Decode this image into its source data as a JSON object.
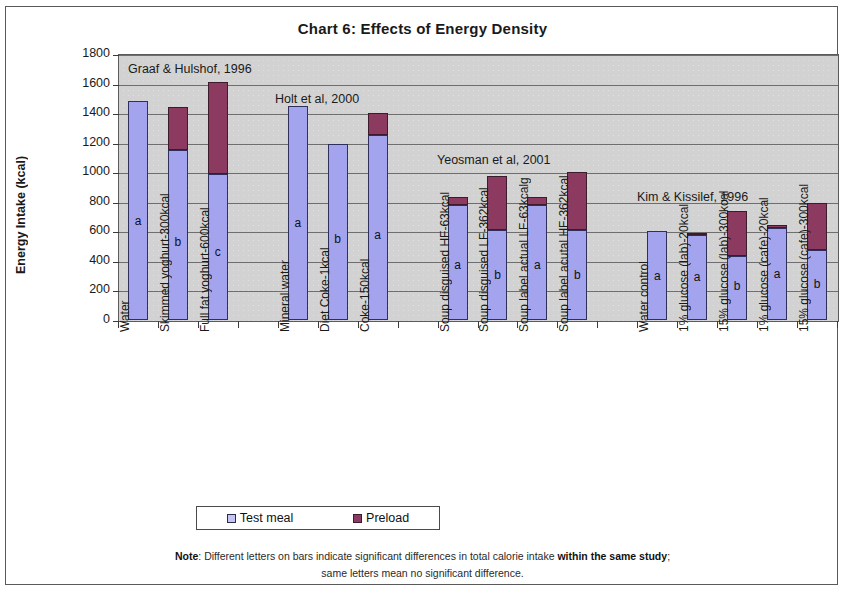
{
  "title": "Chart 6:  Effects of Energy Density",
  "axes": {
    "y_title": "Energy Intake (kcal)",
    "y_ticks": [
      "1800",
      "1600",
      "1400",
      "1200",
      "1000",
      "800",
      "600",
      "400",
      "200",
      "0"
    ]
  },
  "legend": {
    "test_label": "Test meal",
    "preload_label": "Preload"
  },
  "footnote": {
    "note_label": "Note",
    "line1_a": ": Different letters on bars indicate significant differences in total calorie intake ",
    "line1_bold": "within the same study",
    "line1_b": ";",
    "line2": "same letters mean no significant difference."
  },
  "studies": [
    {
      "name": "Graaf &  Hulshof, 1996"
    },
    {
      "name": "Holt et al, 2000"
    },
    {
      "name": "Yeosman et al, 2001"
    },
    {
      "name": "Kim & Kissilef, 1996"
    }
  ],
  "colors": {
    "test_meal": "#a3a3ee",
    "preload": "#8d3a61",
    "plot_background": "#d2d2d2",
    "gridline": "#6e6e6e"
  },
  "chart_data": {
    "type": "bar",
    "title": "Chart 6:  Effects of Energy Density",
    "xlabel": "",
    "ylabel": "Energy Intake (kcal)",
    "ylim": [
      0,
      1800
    ],
    "ytick_step": 200,
    "grid": true,
    "stacked": true,
    "legend_position": "bottom",
    "legend_entries": [
      "Test meal",
      "Preload"
    ],
    "categories": [
      "Water",
      "Skimmed yoghurt-300kcal",
      "Full fat yoghurt-600kcal",
      "Mineral water",
      "Diet Coke-1kcal",
      "Coke-150kcal",
      "Soup disguised HF-63kcal",
      "Soup disguised LF-362kcal",
      "Soup label actual LF-63kcalg",
      "Soup label acutal HF-362kcal",
      "Water control",
      "1% glucose (lab)-20kcal",
      "15% glucose (lab)-300kcal",
      "1% glucose (cafe)-20kcal",
      "15% glucose (cafe)-300kcal"
    ],
    "series": [
      {
        "name": "Test meal",
        "values": [
          1485,
          1150,
          990,
          1450,
          1190,
          1250,
          775,
          610,
          780,
          610,
          600,
          575,
          435,
          625,
          475
        ]
      },
      {
        "name": "Preload",
        "values": [
          0,
          290,
          620,
          0,
          0,
          150,
          55,
          365,
          55,
          390,
          0,
          15,
          305,
          20,
          315
        ]
      }
    ],
    "totals": [
      1485,
      1440,
      1610,
      1450,
      1190,
      1400,
      830,
      975,
      835,
      1000,
      600,
      590,
      740,
      645,
      790
    ],
    "significance_letters": [
      "a",
      "b",
      "c",
      "a",
      "b",
      "a",
      "a",
      "b",
      "a",
      "b",
      "a",
      "a",
      "b",
      "a",
      "b"
    ],
    "study_groups": [
      {
        "label": "Graaf &  Hulshof, 1996",
        "categories": [
          "Water",
          "Skimmed yoghurt-300kcal",
          "Full fat yoghurt-600kcal"
        ]
      },
      {
        "label": "Holt et al, 2000",
        "categories": [
          "Mineral water",
          "Diet Coke-1kcal",
          "Coke-150kcal"
        ]
      },
      {
        "label": "Yeosman et al, 2001",
        "categories": [
          "Soup disguised HF-63kcal",
          "Soup disguised LF-362kcal",
          "Soup label actual LF-63kcalg",
          "Soup label acutal HF-362kcal"
        ]
      },
      {
        "label": "Kim & Kissilef, 1996",
        "categories": [
          "Water control",
          "1% glucose (lab)-20kcal",
          "15% glucose (lab)-300kcal",
          "1% glucose (cafe)-20kcal",
          "15% glucose (cafe)-300kcal"
        ]
      }
    ],
    "annotation": "Different letters on bars indicate significant differences in total calorie intake within the same study; same letters mean no significant difference."
  }
}
